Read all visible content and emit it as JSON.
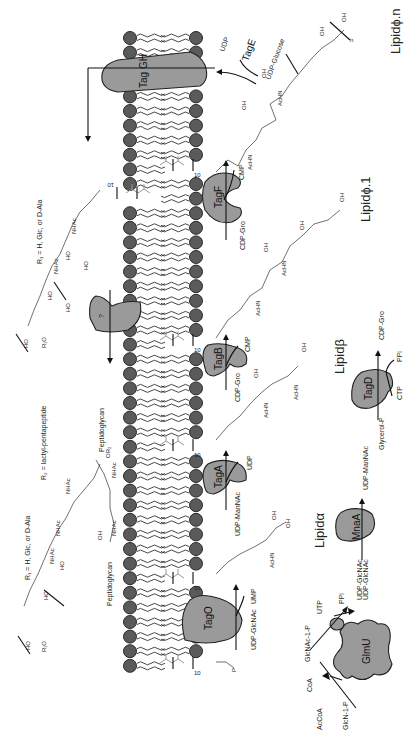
{
  "diagram": {
    "type": "biosynthesis-pathway",
    "orientation": "rotated-90-ccw",
    "colors": {
      "enzyme_fill": "#9a9a9a",
      "lipid_head": "#5a5a5a",
      "outline": "#222222",
      "prenyl_chain": "#999999",
      "background": "#ffffff"
    }
  },
  "enzymes": {
    "taggh": "Tag GH",
    "tage": "TagE",
    "tagf": "TagF",
    "tagb": "TagB",
    "taga": "TagA",
    "tago": "TagO",
    "tagd": "TagD",
    "mnaa": "MnaA",
    "glmu": "GlmU",
    "unknown": "?"
  },
  "intermediates": {
    "lipid_alpha": "Lipidα",
    "lipid_beta": "Lipidβ",
    "lipid_phi1": "Lipidϕ.1",
    "lipid_phin": "Lipidϕ.n"
  },
  "reactants": {
    "udp_glcnac_tago": "UDP-GlcNAc",
    "ump": "UMP",
    "udp_mannac_taga": "UDP-ManNAc",
    "udp_taga": "UDP",
    "cdp_gro_tagb": "CDP-Gro",
    "cmp_tagb": "CMP",
    "cdp_gro_tagf": "CDP-Gro",
    "cmp_tagf": "CMP",
    "udp_glucose": "UDP-Glucose",
    "udp_tage": "UDP",
    "glycerol_p": "Glycerol-P",
    "ctp": "CTP",
    "ppi_tagd": "PPi",
    "cdp_gro_tagd": "CDP-Gro",
    "udp_glcnac_mnaa": "UDP-GlcNAc",
    "udp_mannac_mnaa": "UDP-ManNAc",
    "glcn_1p": "GlcN-1-P",
    "acoa": "AcCoA",
    "coa": "CoA",
    "glcnac_1p": "GlcNAc-1-P",
    "utp": "UTP",
    "ppi_glmu": "PPi",
    "udp_glcnac_glmu": "UDP-GlcNAc"
  },
  "annotations": {
    "r1_top": "R₁ = H, Glc, or D-Ala",
    "r1_bottom": "R₁ = H, Glc, or D-Ala",
    "r2": "R₂ = lactyl-pentapeptide",
    "peptidoglycan_a": "Peptidoglycan",
    "peptidoglycan_b": "Peptidoglycan",
    "prenyl_repeat": "10",
    "repeat_n": "n"
  },
  "chem_labels": {
    "nhac": "NHAc",
    "achn": "AcHN",
    "oh": "OH",
    "ho": "HO",
    "or2": "OR₂",
    "r1o": "R₁O",
    "p": "P",
    "o": "O"
  }
}
